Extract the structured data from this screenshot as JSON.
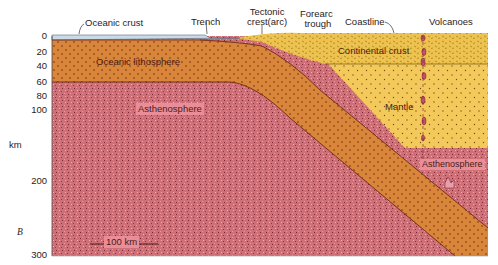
{
  "diagram": {
    "type": "geologic-cross-section",
    "top_labels": {
      "oceanic_crust": "Oceanic crust",
      "trench": "Trench",
      "tectonic_crest": "Tectonic\ncrest(arc)",
      "tectonic_crest_line1": "Tectonic",
      "tectonic_crest_line2": "crest(arc)",
      "forearc_trough_line1": "Forearc",
      "forearc_trough_line2": "trough",
      "coastline": "Coastline",
      "volcanoes": "Volcanoes"
    },
    "layers": {
      "oceanic_lithosphere": "Oceanic lithosphere",
      "asthenosphere_left": "Asthenosphere",
      "continental_crust": "Continental crust",
      "mantle": "Mantle",
      "asthenosphere_right": "Asthenosphere"
    },
    "depth_axis": {
      "unit": "km",
      "ticks": [
        "0",
        "20",
        "40",
        "60",
        "80",
        "100",
        "200",
        "300"
      ]
    },
    "scale_bar": "100 km",
    "panel_label": "B",
    "colors": {
      "ocean_water": "#c9dbe8",
      "oceanic_lithosphere": "#d9853a",
      "asthenosphere": "#cf6f78",
      "continental_crust": "#edc24f",
      "mantle": "#f2c95a",
      "magma": "#c9506a"
    }
  }
}
